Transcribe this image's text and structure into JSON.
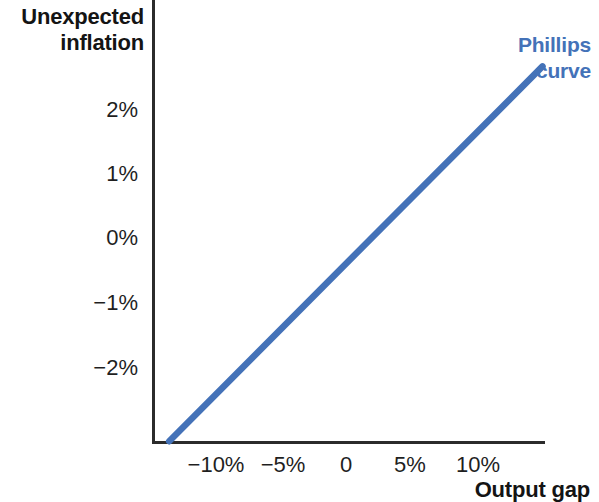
{
  "chart_data": {
    "type": "line",
    "title": "",
    "xlabel": "Output gap",
    "ylabel": "Unexpected inflation",
    "ylabel_lines": [
      "Unexpected",
      "inflation"
    ],
    "xlim": [
      -13.5,
      16.5
    ],
    "ylim": [
      -3.2,
      2.7
    ],
    "grid": false,
    "legend_position": "top-right-inline",
    "xticks": [
      {
        "value": -10,
        "label": "−10%"
      },
      {
        "value": -5,
        "label": "−5%"
      },
      {
        "value": 0,
        "label": "0"
      },
      {
        "value": 5,
        "label": "5%"
      },
      {
        "value": 10,
        "label": "10%"
      }
    ],
    "yticks": [
      {
        "value": 2,
        "label": "2%"
      },
      {
        "value": 1,
        "label": "1%"
      },
      {
        "value": 0,
        "label": "0%"
      },
      {
        "value": -1,
        "label": "−1%"
      },
      {
        "value": -2,
        "label": "−2%"
      }
    ],
    "series": [
      {
        "name": "Phillips curve",
        "name_lines": [
          "Phillips",
          "curve"
        ],
        "color": "#4472b8",
        "x": [
          -13.5,
          15.0
        ],
        "values": [
          -3.15,
          2.66
        ],
        "slope_per_pct_gap": 0.204,
        "points": [
          {
            "x": -13.5,
            "y": -3.15
          },
          {
            "x": -10.0,
            "y": -2.43
          },
          {
            "x": -5.0,
            "y": -1.41
          },
          {
            "x": 0.0,
            "y": -0.39
          },
          {
            "x": 5.0,
            "y": 0.63
          },
          {
            "x": 10.0,
            "y": 1.64
          },
          {
            "x": 15.0,
            "y": 2.66
          }
        ]
      }
    ]
  },
  "axes": {
    "axis_color": "#2b2b2b",
    "background": "#ffffff",
    "text_color": "#1f1f1f",
    "title_color": "#141414"
  }
}
